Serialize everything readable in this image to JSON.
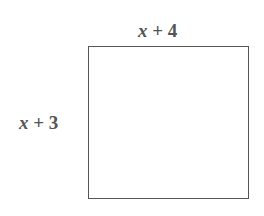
{
  "diagram": {
    "shape": "rectangle",
    "top_side": {
      "variable": "x",
      "operator": "+",
      "constant": "4"
    },
    "left_side": {
      "variable": "x",
      "operator": "+",
      "constant": "3"
    },
    "colors": {
      "stroke": "#555555",
      "text": "#555555",
      "background": "#ffffff"
    }
  }
}
